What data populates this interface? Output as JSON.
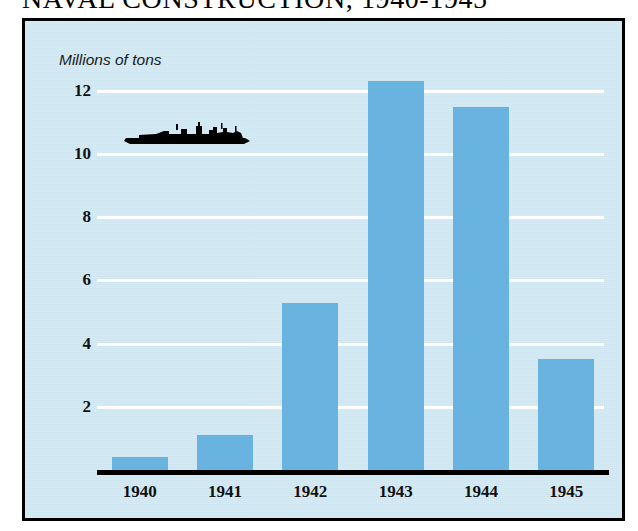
{
  "header": {
    "title": "NAVAL CONSTRUCTION, 1940-1945"
  },
  "chart_data": {
    "type": "bar",
    "title": "NAVAL CONSTRUCTION, 1940-1945",
    "subtitle": "",
    "xlabel": "",
    "ylabel": "Millions of tons",
    "unit_caption": "Millions of tons",
    "categories": [
      "1940",
      "1941",
      "1942",
      "1943",
      "1944",
      "1945"
    ],
    "values": [
      0.4,
      1.1,
      5.3,
      12.3,
      11.5,
      3.5
    ],
    "series": [
      {
        "name": "Naval construction",
        "values": [
          0.4,
          1.1,
          5.3,
          12.3,
          11.5,
          3.5
        ]
      }
    ],
    "ylim": [
      0,
      13.2
    ],
    "yticks": [
      2,
      4,
      6,
      8,
      10,
      12
    ],
    "ytick_labels": [
      "2",
      "4",
      "6",
      "8",
      "10",
      "12"
    ],
    "grid": "horizontal",
    "gridline_color": "#ffffff",
    "legend": "none",
    "bar_color": "#69b3e0",
    "background_color": "#cfe5f0",
    "frame_color": "#000000",
    "axis_color": "#000000",
    "annotations": [
      {
        "name": "battleship-silhouette",
        "kind": "icon",
        "color": "#000000",
        "near_value": 10.5,
        "near_categories": [
          "1940",
          "1941"
        ]
      }
    ]
  }
}
